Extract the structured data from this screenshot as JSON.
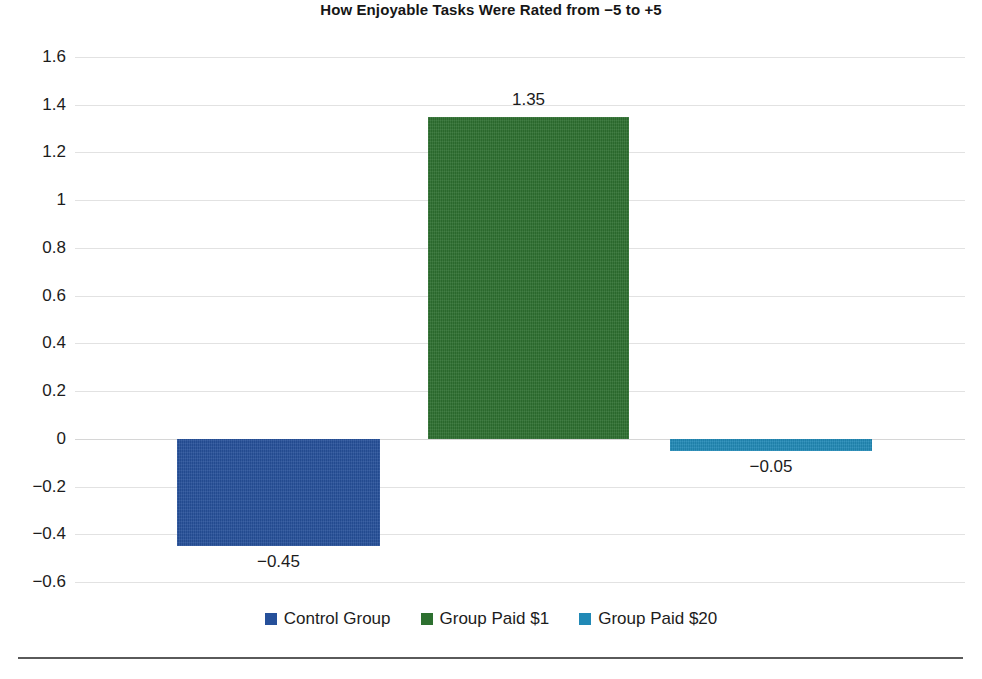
{
  "chart_data": {
    "type": "bar",
    "title": "How Enjoyable Tasks Were Rated from −5 to +5",
    "xlabel": "",
    "ylabel": "",
    "categories": [
      "Control Group",
      "Group Paid $1",
      "Group Paid $20"
    ],
    "values": [
      -0.45,
      1.35,
      -0.05
    ],
    "value_labels": [
      "−0.45",
      "1.35",
      "−0.05"
    ],
    "series": [
      {
        "name": "Control Group",
        "value": -0.45,
        "label": "−0.45",
        "color": "#26509A"
      },
      {
        "name": "Group Paid $1",
        "value": 1.35,
        "label": "1.35",
        "color": "#2D7030"
      },
      {
        "name": "Group Paid $20",
        "value": -0.05,
        "label": "−0.05",
        "color": "#2189B6"
      }
    ],
    "ylim": [
      -0.6,
      1.6
    ],
    "ytick_values": [
      1.6,
      1.4,
      1.2,
      1,
      0.8,
      0.6,
      0.4,
      0.2,
      0,
      -0.2,
      -0.4,
      -0.6
    ],
    "ytick_labels": [
      "1.6",
      "1.4",
      "1.2",
      "1",
      "0.8",
      "0.6",
      "0.4",
      "0.2",
      "0",
      "−0.2",
      "−0.4",
      "−0.6"
    ],
    "grid": true,
    "grid_axis": "y",
    "legend_position": "bottom",
    "legend": [
      {
        "label": "Control Group",
        "color": "#26509A"
      },
      {
        "label": "Group Paid $1",
        "color": "#2D7030"
      },
      {
        "label": "Group Paid $20",
        "color": "#2189B6"
      }
    ],
    "colors": {
      "control_group": "#26509A",
      "group_paid_1": "#2D7030",
      "group_paid_20": "#2189B6",
      "gridline": "#e2e2e2",
      "zero_line": "#d6d6d6",
      "bottom_rule": "#5a5a5a",
      "text": "#1c1c1c",
      "background": "#ffffff"
    }
  }
}
